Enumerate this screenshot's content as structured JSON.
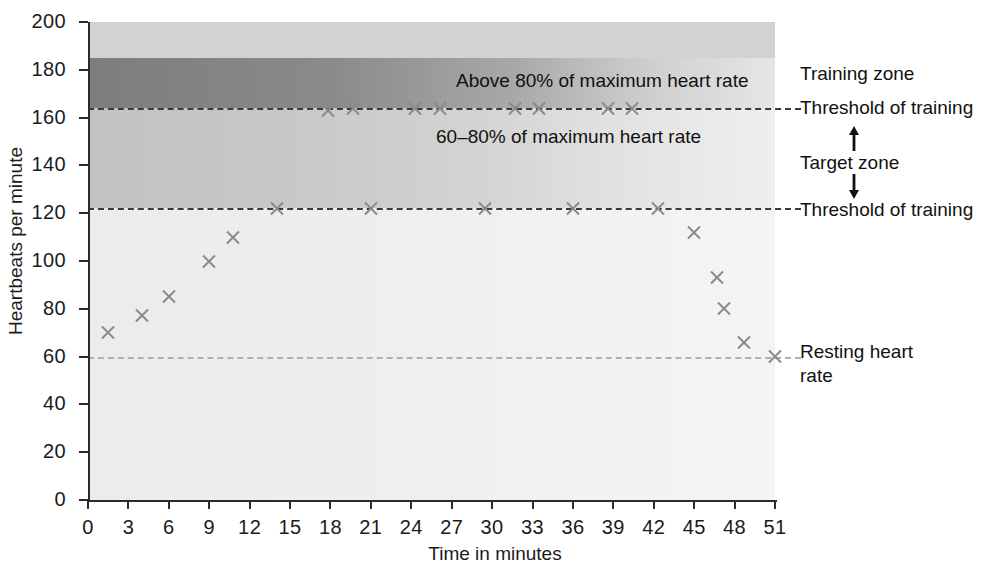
{
  "chart_data": {
    "type": "scatter",
    "title": "",
    "xlabel": "Time in minutes",
    "ylabel": "Heartbeats per minute",
    "xlim": [
      0,
      51
    ],
    "ylim": [
      0,
      200
    ],
    "xticks": [
      0,
      3,
      6,
      9,
      12,
      15,
      18,
      21,
      24,
      27,
      30,
      33,
      36,
      39,
      42,
      45,
      48,
      51
    ],
    "yticks": [
      0,
      20,
      40,
      60,
      80,
      100,
      120,
      140,
      160,
      180,
      200
    ],
    "grid": false,
    "legend_position": "right",
    "series": [
      {
        "name": "Heart rate",
        "marker": "x",
        "color": "#8a8a8a",
        "points": [
          {
            "x": 1.5,
            "y": 70
          },
          {
            "x": 4.0,
            "y": 77
          },
          {
            "x": 6.0,
            "y": 85
          },
          {
            "x": 9.0,
            "y": 100
          },
          {
            "x": 10.8,
            "y": 110
          },
          {
            "x": 14.0,
            "y": 122
          },
          {
            "x": 17.8,
            "y": 163
          },
          {
            "x": 19.7,
            "y": 164
          },
          {
            "x": 21.0,
            "y": 122
          },
          {
            "x": 24.3,
            "y": 164
          },
          {
            "x": 26.1,
            "y": 164
          },
          {
            "x": 29.5,
            "y": 122
          },
          {
            "x": 31.7,
            "y": 164
          },
          {
            "x": 33.5,
            "y": 164
          },
          {
            "x": 36.0,
            "y": 122
          },
          {
            "x": 38.6,
            "y": 164
          },
          {
            "x": 40.4,
            "y": 164
          },
          {
            "x": 42.3,
            "y": 122
          },
          {
            "x": 45.0,
            "y": 112
          },
          {
            "x": 46.7,
            "y": 93
          },
          {
            "x": 47.2,
            "y": 80
          },
          {
            "x": 48.7,
            "y": 66
          },
          {
            "x": 51.0,
            "y": 60
          }
        ]
      }
    ],
    "reference_lines": [
      {
        "name": "upper-threshold",
        "y": 163.5,
        "style": "dashed",
        "color": "#3a3a3a"
      },
      {
        "name": "lower-threshold",
        "y": 121.5,
        "style": "dashed",
        "color": "#3a3a3a"
      },
      {
        "name": "resting-heart-rate",
        "y": 60,
        "style": "dashed",
        "color": "#b0b0b0"
      }
    ],
    "zones": [
      {
        "name": "above-maximum",
        "from": 185,
        "to": 200,
        "shade": "light-grey"
      },
      {
        "name": "above-80-percent",
        "from": 164,
        "to": 185,
        "shade": "dark-grey"
      },
      {
        "name": "target-zone",
        "from": 122,
        "to": 164,
        "shade": "medium-grey"
      },
      {
        "name": "below-target",
        "from": 0,
        "to": 122,
        "shade": "very-light-grey"
      }
    ]
  },
  "axes": {
    "y_title": "Heartbeats per minute",
    "x_title": "Time in minutes",
    "y_labels": [
      "200",
      "180",
      "160",
      "140",
      "120",
      "100",
      "80",
      "60",
      "40",
      "20",
      "0"
    ],
    "x_labels": [
      "0",
      "3",
      "6",
      "9",
      "12",
      "15",
      "18",
      "21",
      "24",
      "27",
      "30",
      "33",
      "36",
      "39",
      "42",
      "45",
      "48",
      "51"
    ]
  },
  "annotations": {
    "above_80": "Above 80% of maximum heart rate",
    "target_range": "60–80% of maximum heart rate"
  },
  "side_labels": {
    "training_zone": "Training zone",
    "threshold_upper": "Threshold of training",
    "target_zone": "Target zone",
    "threshold_lower": "Threshold of training",
    "resting_line1": "Resting heart",
    "resting_line2": "rate"
  }
}
